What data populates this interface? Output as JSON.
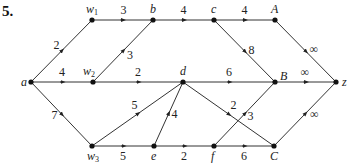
{
  "problem_number": "5.",
  "colors": {
    "edge": "#333333",
    "node": "#111111",
    "text": "#222222"
  },
  "nodes": [
    {
      "id": "a",
      "label": "a",
      "x": 31,
      "y": 82,
      "lx": -10,
      "ly": 4,
      "sub": ""
    },
    {
      "id": "w1",
      "label": "w",
      "sub": "1",
      "x": 92,
      "y": 20,
      "lx": -6,
      "ly": -7
    },
    {
      "id": "b",
      "label": "b",
      "x": 153,
      "y": 20,
      "lx": -3,
      "ly": -7,
      "sub": ""
    },
    {
      "id": "c",
      "label": "c",
      "x": 214,
      "y": 20,
      "lx": -3,
      "ly": -7,
      "sub": ""
    },
    {
      "id": "A",
      "label": "A",
      "x": 275,
      "y": 20,
      "lx": -4,
      "ly": -7,
      "sub": ""
    },
    {
      "id": "w2",
      "label": "w",
      "sub": "2",
      "x": 93,
      "y": 82,
      "lx": -10,
      "ly": -7
    },
    {
      "id": "d",
      "label": "d",
      "x": 183,
      "y": 82,
      "lx": -3,
      "ly": -7,
      "sub": ""
    },
    {
      "id": "B",
      "label": "B",
      "x": 275,
      "y": 82,
      "lx": 5,
      "ly": -2,
      "sub": ""
    },
    {
      "id": "z",
      "label": "z",
      "x": 336,
      "y": 82,
      "lx": 6,
      "ly": 4,
      "sub": ""
    },
    {
      "id": "w3",
      "label": "w",
      "sub": "3",
      "x": 92,
      "y": 146,
      "lx": -5,
      "ly": 14
    },
    {
      "id": "e",
      "label": "e",
      "x": 154,
      "y": 146,
      "lx": -3,
      "ly": 14,
      "sub": ""
    },
    {
      "id": "f",
      "label": "f",
      "x": 214,
      "y": 146,
      "lx": -3,
      "ly": 14,
      "sub": ""
    },
    {
      "id": "C",
      "label": "C",
      "x": 274,
      "y": 146,
      "lx": -4,
      "ly": 14,
      "sub": ""
    }
  ],
  "edges": [
    {
      "from": "a",
      "to": "w1",
      "weight": "2",
      "wx": -8,
      "wy": -2
    },
    {
      "from": "w1",
      "to": "b",
      "weight": "3",
      "wx": -2,
      "wy": -6
    },
    {
      "from": "b",
      "to": "c",
      "weight": "4",
      "wx": -3,
      "wy": -6
    },
    {
      "from": "c",
      "to": "A",
      "weight": "4",
      "wx": -3,
      "wy": -6
    },
    {
      "from": "A",
      "to": "z",
      "weight": "∞",
      "wx": 4,
      "wy": 2
    },
    {
      "from": "w2",
      "to": "b",
      "weight": "3",
      "wx": 4,
      "wy": 8
    },
    {
      "from": "a",
      "to": "w2",
      "weight": "4",
      "wx": -3,
      "wy": -6
    },
    {
      "from": "w2",
      "to": "d",
      "weight": "2",
      "wx": -3,
      "wy": -6
    },
    {
      "from": "d",
      "to": "B",
      "weight": "6",
      "wx": -3,
      "wy": -6
    },
    {
      "from": "B",
      "to": "z",
      "weight": "∞",
      "wx": -5,
      "wy": -6
    },
    {
      "from": "c",
      "to": "B",
      "weight": "8",
      "wx": 4,
      "wy": 3
    },
    {
      "from": "a",
      "to": "w3",
      "weight": "7",
      "wx": -10,
      "wy": 5
    },
    {
      "from": "w3",
      "to": "d",
      "weight": "5",
      "wx": -6,
      "wy": -5
    },
    {
      "from": "w3",
      "to": "e",
      "weight": "5",
      "wx": -3,
      "wy": 14
    },
    {
      "from": "e",
      "to": "d",
      "weight": "4",
      "wx": 3,
      "wy": 4
    },
    {
      "from": "e",
      "to": "f",
      "weight": "2",
      "wx": -3,
      "wy": 14
    },
    {
      "from": "f",
      "to": "C",
      "weight": "6",
      "wx": -3,
      "wy": 14
    },
    {
      "from": "d",
      "to": "C",
      "weight": "2",
      "wx": 2,
      "wy": -5
    },
    {
      "from": "f",
      "to": "B",
      "weight": "3",
      "wx": 3,
      "wy": 6
    },
    {
      "from": "C",
      "to": "z",
      "weight": "∞",
      "wx": 5,
      "wy": 4
    }
  ]
}
